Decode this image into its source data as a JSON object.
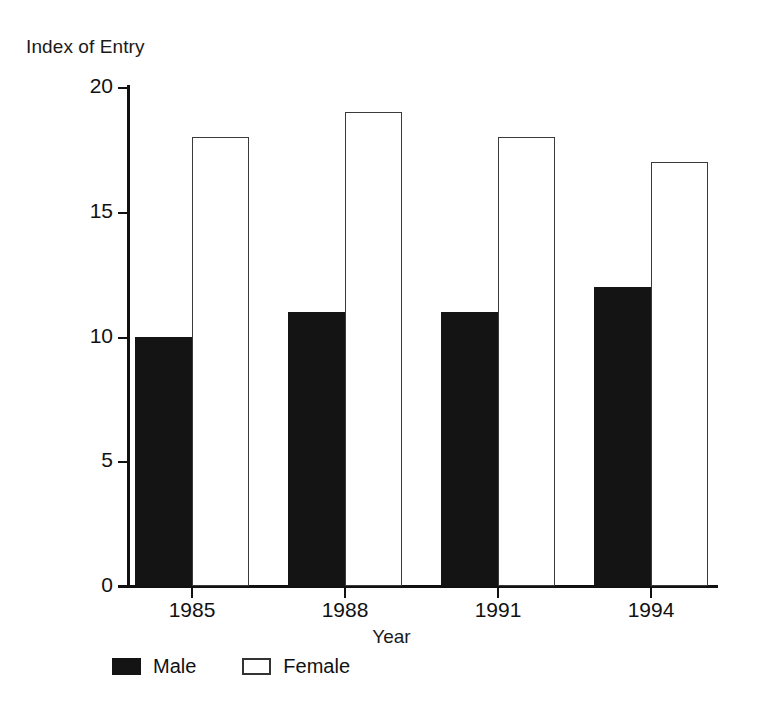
{
  "chart_data": {
    "type": "bar",
    "title": "",
    "xlabel": "Year",
    "ylabel": "Index of Entry",
    "categories": [
      "1985",
      "1988",
      "1991",
      "1994"
    ],
    "series": [
      {
        "name": "Male",
        "values": [
          10,
          11,
          11,
          12
        ],
        "color": "#141414",
        "fill": "solid-black"
      },
      {
        "name": "Female",
        "values": [
          18,
          19,
          18,
          17
        ],
        "color": "#ffffff",
        "fill": "white-outlined"
      }
    ],
    "ylim": [
      0,
      20
    ],
    "yticks": [
      0,
      5,
      10,
      15,
      20
    ],
    "ytick_labels": [
      "0",
      "5",
      "10",
      "15",
      "20"
    ],
    "grid": false,
    "legend_position": "bottom-left",
    "bar_group_layout": "adjacent-pairs"
  },
  "axes": {
    "y_title": "Index of Entry",
    "x_title": "Year"
  },
  "legend": {
    "items": [
      {
        "label": "Male",
        "swatch": "filled-black-square-icon"
      },
      {
        "label": "Female",
        "swatch": "outlined-white-square-icon"
      }
    ]
  }
}
